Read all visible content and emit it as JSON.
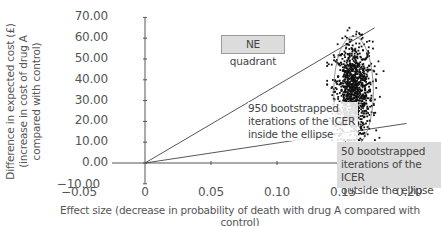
{
  "chart_data": {
    "type": "scatter",
    "title": "",
    "xlabel": "Effect size (decrease in probability of death with drug A compared with control)",
    "ylabel": "Difference in expected cost (£) (increase in cost of drug A compared with control)",
    "xlim": [
      -0.05,
      0.2
    ],
    "ylim": [
      -10.0,
      70.0
    ],
    "x_ticks": [
      "−0.05",
      "0",
      "0.05",
      "0.10",
      "0.15",
      "0.20"
    ],
    "y_ticks": [
      "70.00",
      "60.00",
      "50.00",
      "40.00",
      "30.00",
      "20.00",
      "10.00",
      "0.00",
      "−10.00"
    ],
    "grid": false,
    "legend": null,
    "series": [
      {
        "name": "Bootstrapped ICER iterations",
        "count": 1000,
        "x_center": 0.158,
        "x_spread": [
          0.14,
          0.18
        ],
        "y_center": 35.0,
        "y_spread": [
          12.0,
          64.0
        ]
      }
    ],
    "ellipse": {
      "cx": 0.158,
      "cy": 34.5,
      "rx": 0.015,
      "ry": 26.5,
      "contains": 950
    },
    "reference_lines": [
      {
        "name": "upper-ray",
        "from": [
          0,
          0
        ],
        "to": [
          0.174,
          65.0
        ]
      },
      {
        "name": "lower-ray",
        "from": [
          0,
          0
        ],
        "to": [
          0.198,
          19.0
        ]
      }
    ],
    "annotations": [
      {
        "id": "ne",
        "text": "NE quadrant",
        "x": 0.09,
        "y": 57.0
      },
      {
        "id": "inside",
        "text": "950 bootstrapped iterations of the ICER inside the ellipse",
        "x": 0.078,
        "y": 27.0
      },
      {
        "id": "outside",
        "text": "50 bootstrapped iterations of the ICER outside the ellipse",
        "x": 0.145,
        "y": 7.0
      }
    ]
  },
  "labels": {
    "ne_quadrant": "NE quadrant",
    "inside_line1": "950 bootstrapped",
    "inside_line2": "iterations of the ICER",
    "inside_line3": "inside the ellipse",
    "outside_line1": "50 bootstrapped",
    "outside_line2": "iterations of the ICER",
    "outside_line3": "outside the ellipse"
  },
  "colors": {
    "axis": "#555555",
    "points": "#111111",
    "box_fill": "#dcdcdc",
    "text": "#555555"
  }
}
